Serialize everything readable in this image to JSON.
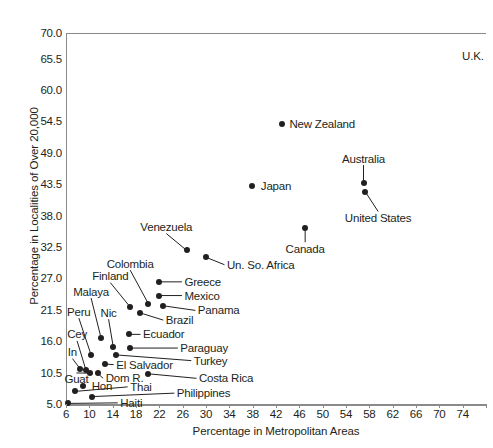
{
  "chart_data": {
    "type": "scatter",
    "title": "",
    "xlabel": "Percentage in Metropolitan Areas",
    "ylabel": "Percentage in Localities of Over 20,000",
    "xlim": [
      6,
      78
    ],
    "ylim": [
      5.0,
      70.0
    ],
    "grid": false,
    "legend": "none",
    "xticks": [
      "6",
      "10",
      "14",
      "18",
      "22",
      "26",
      "30",
      "34",
      "38",
      "42",
      "46",
      "50",
      "54",
      "58",
      "62",
      "66",
      "70",
      "74"
    ],
    "xtick_values": [
      6,
      10,
      14,
      18,
      22,
      26,
      30,
      34,
      38,
      42,
      46,
      50,
      54,
      58,
      62,
      66,
      70,
      74
    ],
    "yticks": [
      "5.0",
      "10.5",
      "16.0",
      "21.5",
      "27.0",
      "32.5",
      "38.0",
      "43.5",
      "49.0",
      "54.5",
      "60.0",
      "65.5",
      "70.0"
    ],
    "ytick_values": [
      5.0,
      10.5,
      16.0,
      21.5,
      27.0,
      32.5,
      38.0,
      43.5,
      49.0,
      54.5,
      60.0,
      65.5,
      70.0
    ],
    "points": [
      {
        "label": "U.K.",
        "x": 78.0,
        "y": 66.0,
        "label_anchor": "right",
        "label_x": 77.6,
        "label_y": 66.0,
        "show_dot": false
      },
      {
        "label": "New Zealand",
        "x": 43.0,
        "y": 54.0,
        "label_anchor": "left",
        "label_x": 44.3,
        "label_y": 54.0,
        "show_dot": true
      },
      {
        "label": "Australia",
        "x": 57.0,
        "y": 43.8,
        "label_anchor": "center",
        "label_x": 57.0,
        "label_y": 48.0,
        "show_dot": true
      },
      {
        "label": "United States",
        "x": 57.3,
        "y": 42.2,
        "label_anchor": "center",
        "label_x": 59.5,
        "label_y": 37.6,
        "show_dot": true
      },
      {
        "label": "Japan",
        "x": 37.8,
        "y": 43.2,
        "label_anchor": "left",
        "label_x": 39.4,
        "label_y": 43.2,
        "show_dot": true
      },
      {
        "label": "Canada",
        "x": 47.0,
        "y": 35.8,
        "label_anchor": "center",
        "label_x": 47.0,
        "label_y": 32.2,
        "show_dot": true
      },
      {
        "label": "Venezuela",
        "x": 26.7,
        "y": 31.9,
        "label_anchor": "center",
        "label_x": 23.2,
        "label_y": 36.0,
        "show_dot": true
      },
      {
        "label": "Un. So. Africa",
        "x": 30.0,
        "y": 30.7,
        "label_anchor": "left",
        "label_x": 33.6,
        "label_y": 29.4,
        "show_dot": true
      },
      {
        "label": "Colombia",
        "x": 20.1,
        "y": 22.6,
        "label_anchor": "center",
        "label_x": 17.0,
        "label_y": 29.6,
        "show_dot": true
      },
      {
        "label": "Greece",
        "x": 22.0,
        "y": 26.4,
        "label_anchor": "left",
        "label_x": 26.3,
        "label_y": 26.4,
        "show_dot": true
      },
      {
        "label": "Mexico",
        "x": 22.0,
        "y": 24.0,
        "label_anchor": "left",
        "label_x": 26.3,
        "label_y": 24.0,
        "show_dot": true
      },
      {
        "label": "Finland",
        "x": 17.0,
        "y": 22.0,
        "label_anchor": "center",
        "label_x": 13.6,
        "label_y": 27.4,
        "show_dot": true
      },
      {
        "label": "Panama",
        "x": 22.7,
        "y": 22.2,
        "label_anchor": "left",
        "label_x": 28.6,
        "label_y": 21.4,
        "show_dot": true
      },
      {
        "label": "Brazil",
        "x": 18.6,
        "y": 21.0,
        "label_anchor": "left",
        "label_x": 23.1,
        "label_y": 19.7,
        "show_dot": true
      },
      {
        "label": "Malaya",
        "x": 12.0,
        "y": 16.6,
        "label_anchor": "center",
        "label_x": 10.3,
        "label_y": 24.7,
        "show_dot": true
      },
      {
        "label": "Peru",
        "x": 10.3,
        "y": 13.6,
        "label_anchor": "center",
        "label_x": 8.2,
        "label_y": 21.2,
        "show_dot": true
      },
      {
        "label": "Nic",
        "x": 14.1,
        "y": 15.0,
        "label_anchor": "center",
        "label_x": 13.3,
        "label_y": 21.0,
        "show_dot": true
      },
      {
        "label": "Ecuador",
        "x": 16.8,
        "y": 17.2,
        "label_anchor": "left",
        "label_x": 19.2,
        "label_y": 17.2,
        "show_dot": true
      },
      {
        "label": "Cey",
        "x": 9.4,
        "y": 11.0,
        "label_anchor": "center",
        "label_x": 7.9,
        "label_y": 17.2,
        "show_dot": true
      },
      {
        "label": "Paraguay",
        "x": 17.0,
        "y": 14.8,
        "label_anchor": "left",
        "label_x": 25.6,
        "label_y": 14.8,
        "show_dot": true
      },
      {
        "label": "Turkey",
        "x": 14.6,
        "y": 13.6,
        "label_anchor": "left",
        "label_x": 27.9,
        "label_y": 12.6,
        "show_dot": true
      },
      {
        "label": "In",
        "x": 8.4,
        "y": 11.2,
        "label_anchor": "center",
        "label_x": 7.1,
        "label_y": 14.1,
        "show_dot": true
      },
      {
        "label": "El Salvador",
        "x": 12.6,
        "y": 12.0,
        "label_anchor": "left",
        "label_x": 14.6,
        "label_y": 11.9,
        "show_dot": true
      },
      {
        "label": "Guat",
        "x": 10.1,
        "y": 10.4,
        "label_anchor": "center",
        "label_x": 7.8,
        "label_y": 9.3,
        "show_dot": true
      },
      {
        "label": "Dom R.",
        "x": 11.4,
        "y": 10.4,
        "label_anchor": "left",
        "label_x": 12.8,
        "label_y": 9.5,
        "show_dot": true
      },
      {
        "label": "Costa Rica",
        "x": 20.0,
        "y": 10.3,
        "label_anchor": "left",
        "label_x": 28.8,
        "label_y": 9.5,
        "show_dot": true
      },
      {
        "label": "Hon",
        "x": 8.9,
        "y": 8.1,
        "label_anchor": "left",
        "label_x": 10.4,
        "label_y": 8.1,
        "show_dot": true
      },
      {
        "label": "Thai",
        "x": 7.5,
        "y": 7.2,
        "label_anchor": "left",
        "label_x": 17.0,
        "label_y": 8.0,
        "show_dot": true
      },
      {
        "label": "Philippines",
        "x": 10.5,
        "y": 6.3,
        "label_anchor": "left",
        "label_x": 25.0,
        "label_y": 6.9,
        "show_dot": true
      },
      {
        "label": "Haiti",
        "x": 6.3,
        "y": 5.1,
        "label_anchor": "left",
        "label_x": 15.3,
        "label_y": 5.2,
        "show_dot": true
      }
    ]
  }
}
